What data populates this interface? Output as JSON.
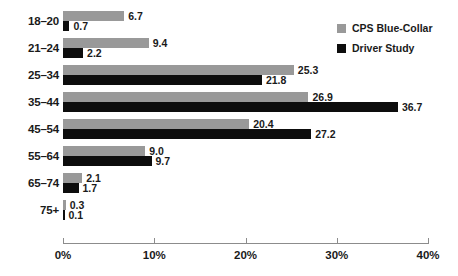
{
  "chart_data": {
    "type": "bar",
    "orientation": "horizontal",
    "title": "",
    "subtitle": "",
    "xlabel": "",
    "ylabel": "",
    "xlim": [
      0,
      40
    ],
    "xticks": [
      0,
      10,
      20,
      30,
      40
    ],
    "xtick_labels": [
      "0%",
      "10%",
      "20%",
      "30%",
      "40%"
    ],
    "grid": false,
    "legend_position": "top-right",
    "categories": [
      "18–20",
      "21–24",
      "25–34",
      "35–44",
      "45–54",
      "55–64",
      "65–74",
      "75+"
    ],
    "series": [
      {
        "name": "CPS Blue-Collar",
        "color": "#999999",
        "values": [
          6.7,
          9.4,
          25.3,
          26.9,
          20.4,
          9.0,
          2.1,
          0.3
        ],
        "labels": [
          "6.7",
          "9.4",
          "25.3",
          "26.9",
          "20.4",
          "9.0",
          "2.1",
          "0.3"
        ]
      },
      {
        "name": "Driver Study",
        "color": "#0d0d0d",
        "values": [
          0.7,
          2.2,
          21.8,
          36.7,
          27.2,
          9.7,
          1.7,
          0.1
        ],
        "labels": [
          "0.7",
          "2.2",
          "21.8",
          "36.7",
          "27.2",
          "9.7",
          "1.7",
          "0.1"
        ]
      }
    ]
  },
  "legend": {
    "items": [
      {
        "label": "CPS Blue-Collar",
        "color": "#999999"
      },
      {
        "label": "Driver Study",
        "color": "#0d0d0d"
      }
    ]
  }
}
